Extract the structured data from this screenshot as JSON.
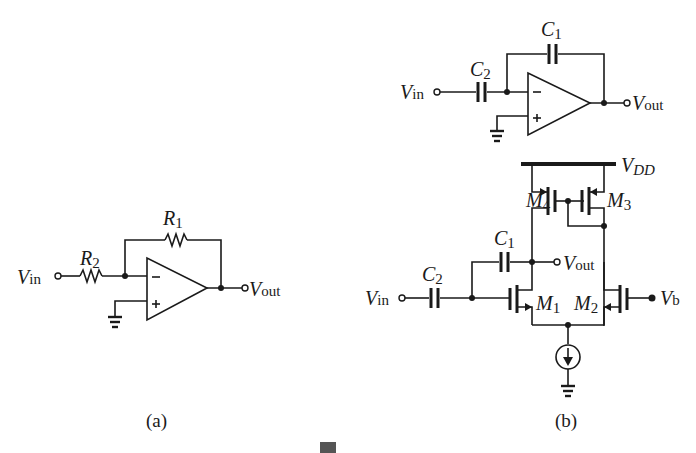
{
  "figure": {
    "panel_a": {
      "caption": "(a)",
      "opamp": {
        "inv_sign": "−",
        "noninv_sign": "+"
      },
      "labels": {
        "vin_main": "V",
        "vin_sub": "in",
        "vout_main": "V",
        "vout_sub": "out",
        "r1_main": "R",
        "r1_sub": "1",
        "r2_main": "R",
        "r2_sub": "2"
      }
    },
    "panel_b": {
      "caption": "(b)",
      "top_circuit": {
        "opamp": {
          "inv_sign": "−",
          "noninv_sign": "+"
        },
        "labels": {
          "vin_main": "V",
          "vin_sub": "in",
          "vout_main": "V",
          "vout_sub": "out",
          "c1_main": "C",
          "c1_sub": "1",
          "c2_main": "C",
          "c2_sub": "2"
        }
      },
      "transistor_circuit": {
        "labels": {
          "vdd_main": "V",
          "vdd_sub": "DD",
          "m1_main": "M",
          "m1_sub": "1",
          "m2_main": "M",
          "m2_sub": "2",
          "m3_main": "M",
          "m3_sub": "3",
          "m4_main": "M",
          "m4_sub": "4",
          "c1_main": "C",
          "c1_sub": "1",
          "c2_main": "C",
          "c2_sub": "2",
          "vin_main": "V",
          "vin_sub": "in",
          "vout_main": "V",
          "vout_sub": "out",
          "vb_main": "V",
          "vb_sub": "b"
        }
      }
    }
  }
}
